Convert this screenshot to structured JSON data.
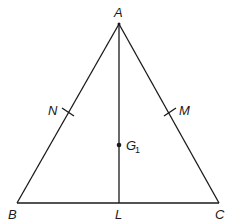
{
  "diagram": {
    "type": "geometry",
    "points": {
      "A": {
        "label": "A",
        "x": 119,
        "y": 24
      },
      "B": {
        "label": "B",
        "x": 17,
        "y": 203
      },
      "C": {
        "label": "C",
        "x": 219,
        "y": 203
      },
      "L": {
        "label": "L",
        "x": 119,
        "y": 203
      },
      "N": {
        "label": "N",
        "x": 68,
        "y": 113
      },
      "M": {
        "label": "M",
        "x": 170,
        "y": 113
      },
      "G1": {
        "label": "G",
        "subscript": "1",
        "x": 119,
        "y": 145
      }
    },
    "segments": [
      "AB",
      "AC",
      "BC",
      "AL"
    ],
    "tick_marks": [
      "N on AB",
      "M on AC"
    ]
  }
}
